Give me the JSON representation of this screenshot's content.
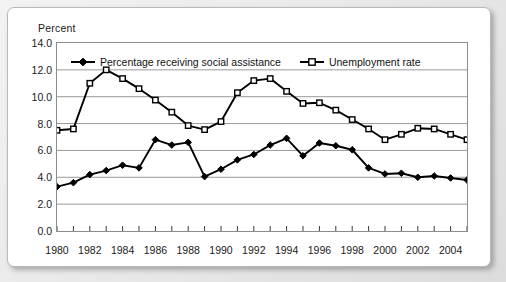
{
  "figure": {
    "y_axis_title": "Percent"
  },
  "legend": {
    "position": "top-inside",
    "entries": [
      {
        "label": "Percentage receiving social assistance",
        "marker": "filled-diamond-marker"
      },
      {
        "label": "Unemployment rate",
        "marker": "open-square-marker"
      }
    ]
  },
  "colors": {
    "line": "#000000",
    "grid": "#9a9a9a",
    "axis": "#6f6f6f",
    "text": "#1a1a1a",
    "plot_background": "#ffffff",
    "page_background": "#e9e9e9"
  },
  "chart_data": {
    "type": "line",
    "title": "",
    "xlabel": "",
    "ylabel": "Percent",
    "ylim": [
      0.0,
      14.0
    ],
    "xlim": [
      1980,
      2005
    ],
    "grid": true,
    "y_ticks": [
      "0.0",
      "2.0",
      "4.0",
      "6.0",
      "8.0",
      "10.0",
      "12.0",
      "14.0"
    ],
    "y_tick_values": [
      0.0,
      2.0,
      4.0,
      6.0,
      8.0,
      10.0,
      12.0,
      14.0
    ],
    "x_tick_labels": [
      "1980",
      "1982",
      "1984",
      "1986",
      "1988",
      "1990",
      "1992",
      "1994",
      "1996",
      "1998",
      "2000",
      "2002",
      "2004"
    ],
    "x_tick_values": [
      1980,
      1982,
      1984,
      1986,
      1988,
      1990,
      1992,
      1994,
      1996,
      1998,
      2000,
      2002,
      2004
    ],
    "x": [
      1980,
      1981,
      1982,
      1983,
      1984,
      1985,
      1986,
      1987,
      1988,
      1989,
      1990,
      1991,
      1992,
      1993,
      1994,
      1995,
      1996,
      1997,
      1998,
      1999,
      2000,
      2001,
      2002,
      2003,
      2004,
      2005
    ],
    "series": [
      {
        "name": "Percentage receiving social assistance",
        "marker": "filled-diamond-marker",
        "values": [
          3.3,
          3.6,
          4.2,
          4.5,
          4.9,
          4.7,
          6.8,
          6.4,
          6.6,
          4.05,
          4.6,
          5.3,
          5.7,
          6.4,
          6.9,
          5.6,
          6.55,
          6.35,
          6.05,
          4.7,
          4.25,
          4.3,
          4.0,
          4.1,
          3.95,
          3.8
        ]
      },
      {
        "name": "Unemployment rate",
        "marker": "open-square-marker",
        "values": [
          7.5,
          7.6,
          11.0,
          12.0,
          11.35,
          10.6,
          9.75,
          8.85,
          7.85,
          7.55,
          8.15,
          10.3,
          11.2,
          11.35,
          10.4,
          9.5,
          9.55,
          9.0,
          8.3,
          7.6,
          6.8,
          7.2,
          7.65,
          7.6,
          7.2,
          6.8
        ]
      }
    ]
  }
}
